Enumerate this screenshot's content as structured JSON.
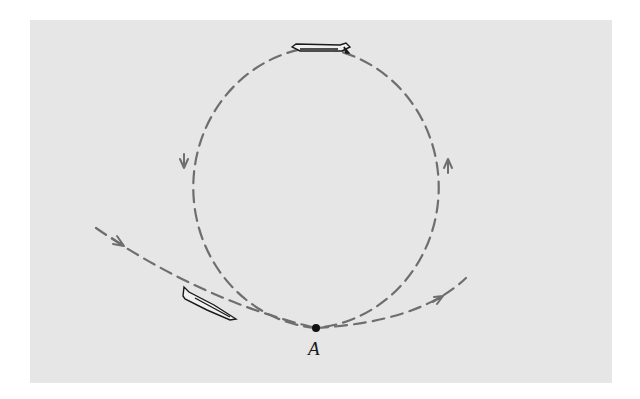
{
  "figure": {
    "background_color": "#e6e6e6",
    "path_color": "#6e6e6e",
    "point": {
      "label": "A",
      "position": "bottom of loop"
    },
    "airplanes": [
      {
        "position": "top of loop",
        "orientation": "inverted, flying left"
      },
      {
        "position": "entering loop, lower left",
        "orientation": "descending to the right"
      }
    ],
    "arrows": [
      {
        "position": "entry path left",
        "direction": "down-right"
      },
      {
        "position": "right side of loop",
        "direction": "up"
      },
      {
        "position": "left side of loop",
        "direction": "down"
      },
      {
        "position": "exit path right",
        "direction": "up-right"
      }
    ]
  }
}
